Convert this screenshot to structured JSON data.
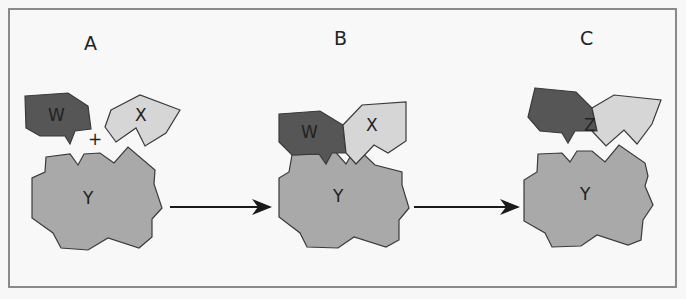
{
  "diagram": {
    "type": "enzyme-substrate reaction sequence",
    "colors": {
      "w": "#565656",
      "x": "#d6d6d6",
      "y": "#a9a9a9",
      "z_w_part": "#565656",
      "z_x_part": "#d6d6d6",
      "outline": "#3a3a3a",
      "arrow": "#1a1a1a",
      "border": "#8a8a8a"
    },
    "panels": [
      {
        "label": "A",
        "shapes": {
          "w": "W",
          "x": "X",
          "y": "Y",
          "plus": "+"
        }
      },
      {
        "label": "B",
        "shapes": {
          "w": "W",
          "x": "X",
          "y": "Y"
        }
      },
      {
        "label": "C",
        "shapes": {
          "z": "Z",
          "y": "Y"
        }
      }
    ],
    "arrows": [
      {
        "from": "A",
        "to": "B"
      },
      {
        "from": "B",
        "to": "C"
      }
    ]
  }
}
